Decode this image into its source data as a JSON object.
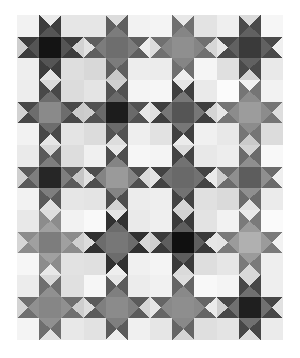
{
  "artwork": {
    "title": "Ohio Star Quilt Pattern",
    "type": "quilt-grid",
    "background_color": "#ffffff",
    "canvas": {
      "width": 300,
      "height": 358
    },
    "quilt_area": {
      "x": 17,
      "y": 15,
      "width": 266,
      "height": 325
    },
    "grid": {
      "columns": 4,
      "rows": 5
    },
    "block": {
      "name": "ohio-star",
      "width": 66.5,
      "height": 65.0,
      "cells": 3,
      "description": "3x3 block: four plain corner squares, one solid center square, four quarter-square-triangle hourglass units forming the star points"
    },
    "palette": {
      "near_black": "#141414",
      "very_dark": "#2a2a2a",
      "dark": "#3d3d3d",
      "dark_mid": "#525252",
      "mid_dark": "#636363",
      "mid": "#7a7a7a",
      "mid_light": "#9a9a9a",
      "light_mid": "#b4b4b4",
      "light": "#cfcfcf",
      "lighter": "#e0e0e0",
      "very_light": "#eeeeee",
      "near_white": "#f7f7f7",
      "white": "#ffffff"
    },
    "blocks": [
      {
        "row": 0,
        "col": 0,
        "center": "#141414",
        "point": "#3d3d3d",
        "point_alt": "#555555",
        "corner_tl": "#f2f2f2",
        "corner_tr": "#e6e6e6",
        "corner_bl": "#eeeeee",
        "corner_br": "#dedede",
        "bg_top": "#eaeaea",
        "bg_right": "#d2d2d2",
        "bg_bottom": "#e4e4e4",
        "bg_left": "#cfcfcf"
      },
      {
        "row": 0,
        "col": 1,
        "center": "#6e6e6e",
        "point": "#5f5f5f",
        "point_alt": "#7c7c7c",
        "corner_tl": "#e6e6e6",
        "corner_tr": "#f2f2f2",
        "corner_bl": "#d8d8d8",
        "corner_br": "#ededed",
        "bg_top": "#dcdcdc",
        "bg_right": "#ededed",
        "bg_bottom": "#c9c9c9",
        "bg_left": "#e2e2e2"
      },
      {
        "row": 0,
        "col": 2,
        "center": "#8f8f8f",
        "point": "#707070",
        "point_alt": "#858585",
        "corner_tl": "#f4f4f4",
        "corner_tr": "#e3e3e3",
        "corner_bl": "#ececec",
        "corner_br": "#f5f5f5",
        "bg_top": "#e8e8e8",
        "bg_right": "#d6d6d6",
        "bg_bottom": "#efefef",
        "bg_left": "#dddddd"
      },
      {
        "row": 0,
        "col": 3,
        "center": "#3a3a3a",
        "point": "#4a4a4a",
        "point_alt": "#616161",
        "corner_tl": "#efefef",
        "corner_tr": "#f6f6f6",
        "corner_bl": "#e0e0e0",
        "corner_br": "#e9e9e9",
        "bg_top": "#dbdbdb",
        "bg_right": "#f0f0f0",
        "bg_bottom": "#d4d4d4",
        "bg_left": "#e7e7e7"
      },
      {
        "row": 1,
        "col": 0,
        "center": "#8a8a8a",
        "point": "#484848",
        "point_alt": "#6d6d6d",
        "corner_tl": "#ededed",
        "corner_tr": "#dcdcdc",
        "corner_bl": "#f2f2f2",
        "corner_br": "#e4e4e4",
        "bg_top": "#dadada",
        "bg_right": "#cacaca",
        "bg_bottom": "#e6e6e6",
        "bg_left": "#d3d3d3"
      },
      {
        "row": 1,
        "col": 1,
        "center": "#1c1c1c",
        "point": "#525252",
        "point_alt": "#6a6a6a",
        "corner_tl": "#e4e4e4",
        "corner_tr": "#f4f4f4",
        "corner_bl": "#dcdcdc",
        "corner_br": "#eeeeee",
        "bg_top": "#d0d0d0",
        "bg_right": "#e8e8e8",
        "bg_bottom": "#dddddd",
        "bg_left": "#cdcdcd"
      },
      {
        "row": 1,
        "col": 2,
        "center": "#555555",
        "point": "#3f3f3f",
        "point_alt": "#777777",
        "corner_tl": "#f6f6f6",
        "corner_tr": "#eaeaea",
        "corner_bl": "#e2e2e2",
        "corner_br": "#f0f0f0",
        "bg_top": "#e6e6e6",
        "bg_right": "#d4d4d4",
        "bg_bottom": "#ebebeb",
        "bg_left": "#dfdfdf"
      },
      {
        "row": 1,
        "col": 3,
        "center": "#9c9c9c",
        "point": "#757575",
        "point_alt": "#8c8c8c",
        "corner_tl": "#fbfbfb",
        "corner_tr": "#f2f2f2",
        "corner_bl": "#e8e8e8",
        "corner_br": "#dcdcdc",
        "bg_top": "#f1f1f1",
        "bg_right": "#dedede",
        "bg_bottom": "#cacaca",
        "bg_left": "#e6e6e6"
      },
      {
        "row": 2,
        "col": 0,
        "center": "#262626",
        "point": "#5a5a5a",
        "point_alt": "#7e7e7e",
        "corner_tl": "#eaeaea",
        "corner_tr": "#dddddd",
        "corner_bl": "#f2f2f2",
        "corner_br": "#e6e6e6",
        "bg_top": "#d8d8d8",
        "bg_right": "#c6c6c6",
        "bg_bottom": "#e0e0e0",
        "bg_left": "#d0d0d0"
      },
      {
        "row": 2,
        "col": 1,
        "center": "#9a9a9a",
        "point": "#4e4e4e",
        "point_alt": "#848484",
        "corner_tl": "#f0f0f0",
        "corner_tr": "#f6f6f6",
        "corner_bl": "#e4e4e4",
        "corner_br": "#ececec",
        "bg_top": "#e7e7e7",
        "bg_right": "#dadada",
        "bg_bottom": "#d2d2d2",
        "bg_left": "#e1e1e1"
      },
      {
        "row": 2,
        "col": 2,
        "center": "#696969",
        "point": "#434343",
        "point_alt": "#727272",
        "corner_tl": "#f4f4f4",
        "corner_tr": "#e8e8e8",
        "corner_bl": "#eeeeee",
        "corner_br": "#e0e0e0",
        "bg_top": "#dcdcdc",
        "bg_right": "#eaeaea",
        "bg_bottom": "#d6d6d6",
        "bg_left": "#e4e4e4"
      },
      {
        "row": 2,
        "col": 3,
        "center": "#5d5d5d",
        "point": "#6b6b6b",
        "point_alt": "#8f8f8f",
        "corner_tl": "#ededed",
        "corner_tr": "#f8f8f8",
        "corner_bl": "#dadada",
        "corner_br": "#ebebeb",
        "bg_top": "#d4d4d4",
        "bg_right": "#efefef",
        "bg_bottom": "#e2e2e2",
        "bg_left": "#cccccc"
      },
      {
        "row": 3,
        "col": 0,
        "center": "#7d7d7d",
        "point": "#8c8c8c",
        "point_alt": "#a0a0a0",
        "corner_tl": "#e8e8e8",
        "corner_tr": "#f2f2f2",
        "corner_bl": "#f6f6f6",
        "corner_br": "#e2e2e2",
        "bg_top": "#dddddd",
        "bg_right": "#d0d0d0",
        "bg_bottom": "#e8e8e8",
        "bg_left": "#d6d6d6"
      },
      {
        "row": 3,
        "col": 1,
        "center": "#777777",
        "point": "#313131",
        "point_alt": "#6c6c6c",
        "corner_tl": "#f9f9f9",
        "corner_tr": "#eaeaea",
        "corner_bl": "#e0e0e0",
        "corner_br": "#f0f0f0",
        "bg_top": "#e4e4e4",
        "bg_right": "#d8d8d8",
        "bg_bottom": "#eeeeee",
        "bg_left": "#dcdcdc"
      },
      {
        "row": 3,
        "col": 2,
        "center": "#101010",
        "point": "#3a3a3a",
        "point_alt": "#5e5e5e",
        "corner_tl": "#efefef",
        "corner_tr": "#e3e3e3",
        "corner_bl": "#f4f4f4",
        "corner_br": "#dedede",
        "bg_top": "#d2d2d2",
        "bg_right": "#e6e6e6",
        "bg_bottom": "#dadada",
        "bg_left": "#cfcfcf"
      },
      {
        "row": 3,
        "col": 3,
        "center": "#b0b0b0",
        "point": "#7a7a7a",
        "point_alt": "#9b9b9b",
        "corner_tl": "#f2f2f2",
        "corner_tr": "#fafafa",
        "corner_bl": "#e6e6e6",
        "corner_br": "#eeeeee",
        "bg_top": "#eaeaea",
        "bg_right": "#f2f2f2",
        "bg_bottom": "#d8d8d8",
        "bg_left": "#e4e4e4"
      },
      {
        "row": 4,
        "col": 0,
        "center": "#868686",
        "point": "#6f6f6f",
        "point_alt": "#909090",
        "corner_tl": "#ececec",
        "corner_tr": "#e0e0e0",
        "corner_bl": "#f4f4f4",
        "corner_br": "#e8e8e8",
        "bg_top": "#d9d9d9",
        "bg_right": "#cecece",
        "bg_bottom": "#e2e2e2",
        "bg_left": "#d4d4d4"
      },
      {
        "row": 4,
        "col": 1,
        "center": "#8b8b8b",
        "point": "#5b5b5b",
        "point_alt": "#7f7f7f",
        "corner_tl": "#f6f6f6",
        "corner_tr": "#ececec",
        "corner_bl": "#e2e2e2",
        "corner_br": "#f0f0f0",
        "bg_top": "#e6e6e6",
        "bg_right": "#d6d6d6",
        "bg_bottom": "#ededed",
        "bg_left": "#dddddd"
      },
      {
        "row": 4,
        "col": 2,
        "center": "#8e8e8e",
        "point": "#656565",
        "point_alt": "#898989",
        "corner_tl": "#f1f1f1",
        "corner_tr": "#f8f8f8",
        "corner_bl": "#e6e6e6",
        "corner_br": "#dfdfdf",
        "bg_top": "#dedede",
        "bg_right": "#ebebeb",
        "bg_bottom": "#d5d5d5",
        "bg_left": "#e6e6e6"
      },
      {
        "row": 4,
        "col": 3,
        "center": "#1f1f1f",
        "point": "#474747",
        "point_alt": "#707070",
        "corner_tl": "#f4f4f4",
        "corner_tr": "#eeeeee",
        "corner_bl": "#e4e4e4",
        "corner_br": "#ebebeb",
        "bg_top": "#d8d8d8",
        "bg_right": "#e2e2e2",
        "bg_bottom": "#dcdcdc",
        "bg_left": "#d0d0d0"
      }
    ]
  }
}
